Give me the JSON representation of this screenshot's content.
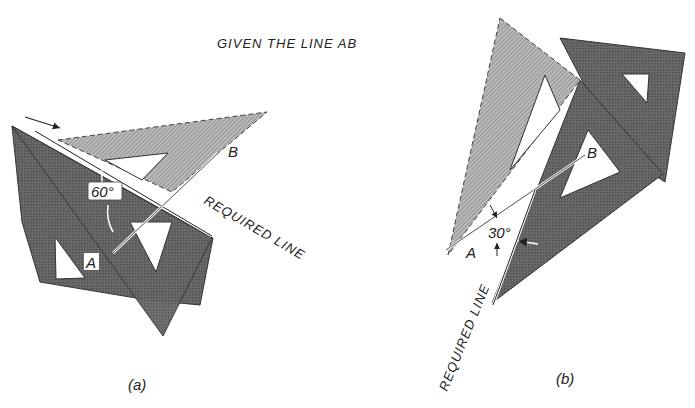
{
  "title": "GIVEN THE LINE AB",
  "colors": {
    "dark_triangle": "#5a5a5a",
    "light_triangle": "#9a9a9a",
    "line": "#222222",
    "background": "#ffffff"
  },
  "figure_a": {
    "caption": "(a)",
    "angle_label": "60°",
    "point_a": "A",
    "point_b": "B",
    "required_line_label": "REQUIRED LINE"
  },
  "figure_b": {
    "caption": "(b)",
    "angle_label": "30°",
    "point_a": "A",
    "point_b": "B",
    "required_line_label": "REQUIRED LINE"
  }
}
